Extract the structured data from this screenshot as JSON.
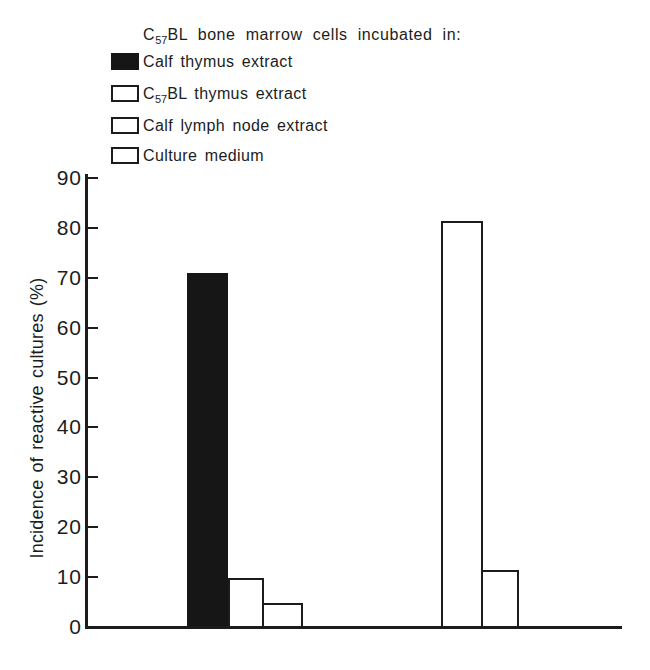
{
  "figure": {
    "legend_title": {
      "prefix": "C",
      "subscript": "57",
      "suffix": "BL bone marrow cells incubated in:"
    },
    "legend_items": [
      {
        "label": "Calf thymus extract",
        "swatch": "solid-black"
      },
      {
        "prefix": "C",
        "subscript": "57",
        "suffix": "BL thymus extract",
        "swatch": "diagonal-hatch"
      },
      {
        "label": "Calf lymph node extract",
        "swatch": "stipple"
      },
      {
        "label": "Culture medium",
        "swatch": "open-white"
      }
    ],
    "y_axis_label": "Incidence of reactive cultures (%)"
  },
  "chart_data": {
    "type": "bar",
    "title": "C57BL bone marrow cells incubated in:",
    "xlabel": "",
    "ylabel": "Incidence of reactive cultures (%)",
    "ylim": [
      0,
      90
    ],
    "yticks": [
      0,
      10,
      20,
      30,
      40,
      50,
      60,
      70,
      80,
      90
    ],
    "grid": false,
    "legend_position": "top-left",
    "colors": {
      "ink": "#1c1c1c",
      "paper": "#ffffff"
    },
    "groups": [
      {
        "name": "group-1",
        "bars": [
          {
            "series": "Calf thymus extract",
            "value": 71,
            "pattern": "solid-black"
          },
          {
            "series": "Culture medium",
            "value": 9.7,
            "pattern": "open-white"
          },
          {
            "series": "Calf lymph node extract",
            "value": 4.8,
            "pattern": "stipple"
          }
        ]
      },
      {
        "name": "group-2",
        "bars": [
          {
            "series": "C57BL thymus extract",
            "value": 81.5,
            "pattern": "diagonal-hatch"
          },
          {
            "series": "Culture medium",
            "value": 11.4,
            "pattern": "open-white"
          }
        ]
      }
    ]
  }
}
